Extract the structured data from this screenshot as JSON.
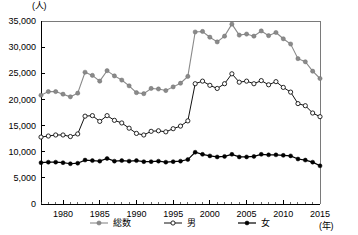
{
  "chart_data": {
    "type": "line",
    "title": "",
    "xlabel": "(年)",
    "ylabel": "(人)",
    "xlim": [
      1977,
      2015
    ],
    "ylim": [
      0,
      35000
    ],
    "grid": false,
    "legend_position": "bottom",
    "ytick_labels": [
      "35,000",
      "30,000",
      "25,000",
      "20,000",
      "15,000",
      "10,000",
      "5,000",
      "0"
    ],
    "ytick_values": [
      35000,
      30000,
      25000,
      20000,
      15000,
      10000,
      5000,
      0
    ],
    "xtick_labels": [
      "1980",
      "1985",
      "1990",
      "1995",
      "2000",
      "2005",
      "2010",
      "2015"
    ],
    "xtick_values": [
      1980,
      1985,
      1990,
      1995,
      2000,
      2005,
      2010,
      2015
    ],
    "x": [
      1977,
      1978,
      1979,
      1980,
      1981,
      1982,
      1983,
      1984,
      1985,
      1986,
      1987,
      1988,
      1989,
      1990,
      1991,
      1992,
      1993,
      1994,
      1995,
      1996,
      1997,
      1998,
      1999,
      2000,
      2001,
      2002,
      2003,
      2004,
      2005,
      2006,
      2007,
      2008,
      2009,
      2010,
      2011,
      2012,
      2013,
      2014,
      2015
    ],
    "series": [
      {
        "name": "総数",
        "marker": "filled-circle",
        "color": "#8a8a8a",
        "values": [
          20800,
          21500,
          21500,
          21000,
          20500,
          21200,
          25200,
          24600,
          23500,
          25500,
          24500,
          23700,
          22600,
          21300,
          21100,
          22100,
          22000,
          21700,
          22400,
          23100,
          24400,
          32900,
          33000,
          31900,
          31000,
          32100,
          34400,
          32300,
          32500,
          32100,
          33100,
          32200,
          32800,
          31600,
          30600,
          27800,
          27200,
          25400,
          24000
        ]
      },
      {
        "name": "男",
        "marker": "open-circle",
        "color": "#111111",
        "values": [
          12800,
          13000,
          13200,
          13200,
          12900,
          13400,
          16800,
          16900,
          15800,
          16900,
          16000,
          15500,
          14500,
          13500,
          13200,
          13900,
          14000,
          13800,
          14400,
          14900,
          15900,
          23000,
          23500,
          22700,
          22100,
          23000,
          24900,
          23300,
          23500,
          23000,
          23600,
          22800,
          23400,
          22300,
          21400,
          19200,
          18800,
          17400,
          16700
        ]
      },
      {
        "name": "女",
        "marker": "filled-circle",
        "color": "#000000",
        "values": [
          7900,
          8000,
          8000,
          7900,
          7700,
          7800,
          8400,
          8300,
          8200,
          8700,
          8200,
          8300,
          8200,
          8300,
          8100,
          8100,
          8200,
          8000,
          8100,
          8200,
          8500,
          9900,
          9500,
          9200,
          9000,
          9100,
          9500,
          9000,
          9000,
          9100,
          9500,
          9400,
          9400,
          9300,
          9200,
          8600,
          8400,
          8000,
          7300
        ]
      }
    ]
  },
  "legend": {
    "items": [
      {
        "label": "総数",
        "marker": "filled-circle-gray"
      },
      {
        "label": "男",
        "marker": "open-circle"
      },
      {
        "label": "女",
        "marker": "filled-circle-black"
      }
    ]
  }
}
